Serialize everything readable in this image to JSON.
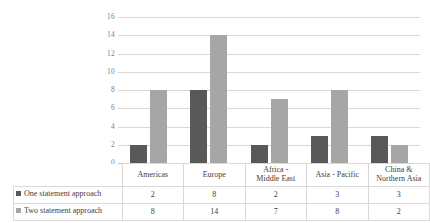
{
  "chart_data": {
    "type": "bar",
    "title": "",
    "subtitle": "",
    "xlabel": "",
    "ylabel": "",
    "categories": [
      "Americas",
      "Europe",
      "Africa - Middle East",
      "Asia - Pacific",
      "China & Northern Asia"
    ],
    "category_lines": [
      [
        "Americas"
      ],
      [
        "Europe"
      ],
      [
        "Africa -",
        "Middle East"
      ],
      [
        "Asia - Pacific"
      ],
      [
        "China &",
        "Northern Asia"
      ]
    ],
    "series": [
      {
        "name": "One statement approach",
        "color": "#595959",
        "values": [
          2,
          8,
          2,
          3,
          3
        ]
      },
      {
        "name": "Two statement approach",
        "color": "#a6a6a6",
        "values": [
          8,
          14,
          7,
          8,
          2
        ]
      }
    ],
    "ylim": [
      0,
      16
    ],
    "yticks": [
      0,
      2,
      4,
      6,
      8,
      10,
      12,
      14,
      16
    ],
    "ytick_labels": [
      "0",
      "2",
      "4",
      "6",
      "8",
      "10",
      "12",
      "14",
      "16"
    ],
    "grid": true,
    "grid_color": "#d9d9d9",
    "legend_position": "data-table-left",
    "has_data_table": true
  },
  "colors": {
    "series_one": "#595959",
    "series_two": "#a6a6a6",
    "gridline": "#d9d9d9",
    "axis_text": "#808080",
    "table_text": "#404040",
    "table_border": "#d9d9d9",
    "background": "#ffffff"
  }
}
